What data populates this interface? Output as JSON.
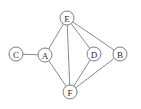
{
  "figure": {
    "type": "undirected-graph",
    "width": 141,
    "height": 109,
    "background_color": "#ffffff",
    "edge_color": "#8a8a8a",
    "node_fill_color": "#ffffff",
    "node_stroke_color": "#7d7d7d",
    "label_color": "#2b2b2b",
    "node_radius": 7
  },
  "nodes": [
    {
      "id": "A",
      "label": "A",
      "x": 45,
      "y": 55
    },
    {
      "id": "B",
      "label": "B",
      "x": 120,
      "y": 54
    },
    {
      "id": "C",
      "label": "C",
      "x": 16,
      "y": 54
    },
    {
      "id": "D",
      "label": "D",
      "x": 94,
      "y": 54
    },
    {
      "id": "E",
      "label": "E",
      "x": 67,
      "y": 18
    },
    {
      "id": "F",
      "label": "F",
      "x": 70,
      "y": 92
    }
  ],
  "edges": [
    {
      "from": "C",
      "to": "A"
    },
    {
      "from": "A",
      "to": "E"
    },
    {
      "from": "A",
      "to": "F"
    },
    {
      "from": "E",
      "to": "F"
    },
    {
      "from": "E",
      "to": "D"
    },
    {
      "from": "E",
      "to": "B"
    },
    {
      "from": "D",
      "to": "F"
    },
    {
      "from": "B",
      "to": "F"
    }
  ]
}
